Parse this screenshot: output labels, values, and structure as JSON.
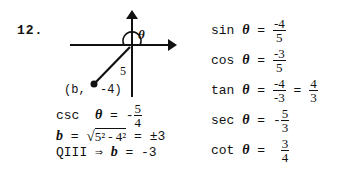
{
  "problem_number": "12.",
  "diagram": {
    "theta_label": "θ",
    "hypotenuse_label": "5",
    "point_label": "(b,  -4)"
  },
  "left_work": {
    "csc": {
      "func": "csc",
      "var": "θ",
      "sign": "-",
      "num": "5",
      "den": "4"
    },
    "b_line": {
      "lhs": "b",
      "eq": " = ",
      "radicand": "5² - 4²",
      "rhs": " = ±3"
    },
    "q_line": {
      "text": "QIII ⇒ ",
      "var": "b",
      "rest": " = -3"
    }
  },
  "right_work": {
    "sin": {
      "func": "sin",
      "var": "θ",
      "num": "-4",
      "den": "5"
    },
    "cos": {
      "func": "cos",
      "var": "θ",
      "num": "-3",
      "den": "5"
    },
    "tan": {
      "func": "tan",
      "var": "θ",
      "num": "-4",
      "den": "-3",
      "num2": "4",
      "den2": "3"
    },
    "sec": {
      "func": "sec",
      "var": "θ",
      "sign": "-",
      "num": "5",
      "den": "3"
    },
    "cot": {
      "func": "cot",
      "var": "θ",
      "num": "3",
      "den": "4"
    }
  }
}
